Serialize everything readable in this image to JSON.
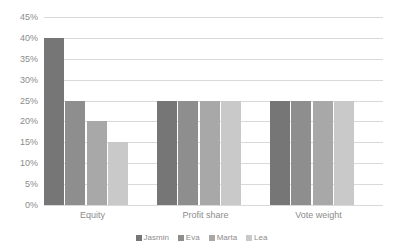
{
  "chart_data": {
    "type": "bar",
    "title": "",
    "title_note": "cropped at top edge, unreadable",
    "xlabel": "",
    "ylabel": "",
    "categories": [
      "Equity",
      "Profit share",
      "Vote weight"
    ],
    "series": [
      {
        "name": "Jasmin",
        "color": "#767676",
        "values": [
          40,
          25,
          25
        ]
      },
      {
        "name": "Eva",
        "color": "#8e8e8e",
        "values": [
          25,
          25,
          25
        ]
      },
      {
        "name": "Marta",
        "color": "#a8a8a8",
        "values": [
          20,
          25,
          25
        ]
      },
      {
        "name": "Lea",
        "color": "#c9c9c9",
        "values": [
          15,
          25,
          25
        ]
      }
    ],
    "ylim": [
      0,
      45
    ],
    "ytick_step": 5,
    "ytick_labels": [
      "45%",
      "40%",
      "35%",
      "30%",
      "25%",
      "20%",
      "15%",
      "10%",
      "5%",
      "0%"
    ],
    "value_format": "percent",
    "grid": {
      "horizontal": true,
      "vertical": false,
      "color": "#d9d9d9"
    },
    "legend": {
      "position": "bottom-center",
      "marker": "square"
    },
    "background": "#ffffff",
    "text_color": "#8c8c8c"
  },
  "yticks": [
    {
      "label": "45%",
      "value": 45
    },
    {
      "label": "40%",
      "value": 40
    },
    {
      "label": "35%",
      "value": 35
    },
    {
      "label": "30%",
      "value": 30
    },
    {
      "label": "25%",
      "value": 25
    },
    {
      "label": "20%",
      "value": 20
    },
    {
      "label": "15%",
      "value": 15
    },
    {
      "label": "10%",
      "value": 10
    },
    {
      "label": "5%",
      "value": 5
    },
    {
      "label": "0%",
      "value": 0
    }
  ]
}
